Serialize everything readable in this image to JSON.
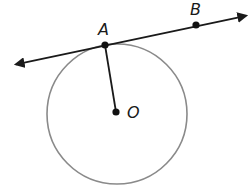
{
  "figure": {
    "points": [
      {
        "label": "A",
        "x": 105,
        "y": 45
      },
      {
        "label": "B",
        "x": 196,
        "y": 25
      },
      {
        "label": "O",
        "x": 116,
        "y": 112
      }
    ],
    "circle": {
      "cx": 117,
      "cy": 114,
      "r": 70,
      "stroke": "#8a8a8a"
    },
    "tangent_line": {
      "x1": 13,
      "y1": 65,
      "x2": 250,
      "y2": 15,
      "stroke": "#1a1a1a",
      "arrows": "both"
    },
    "radius_segment": {
      "from": "A",
      "to": "O"
    }
  }
}
